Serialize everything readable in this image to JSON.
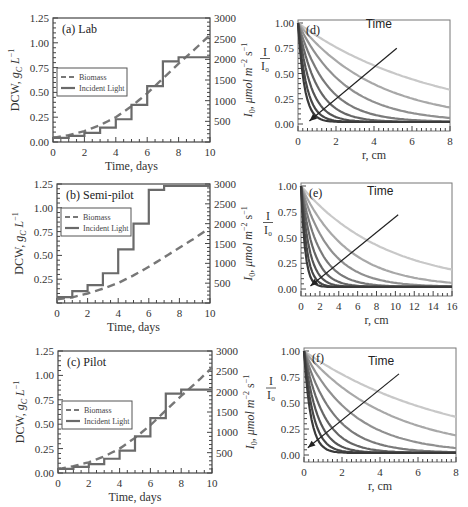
{
  "chart_data": [
    {
      "id": "a",
      "type": "line",
      "title": "(a) Lab",
      "xlabel": "Time, days",
      "ylabel": "DCW, g_C L^-1",
      "ylabel_right": "I_0, μmol m^-2 s^-1",
      "xlim": [
        0,
        10
      ],
      "ylim": [
        0,
        1.25
      ],
      "ylim_right": [
        0,
        3000
      ],
      "xticks": [
        "0",
        "2",
        "4",
        "6",
        "8",
        "10"
      ],
      "yticks": [
        "0.00",
        "0.25",
        "0.50",
        "0.75",
        "1.00",
        "1.25"
      ],
      "yticks_right": [
        "500",
        "1000",
        "1500",
        "2000",
        "2500",
        "3000"
      ],
      "legend": [
        "Biomass",
        "Incident Light"
      ],
      "legend_position": "center-left",
      "series": [
        {
          "name": "Biomass",
          "style": "dashed",
          "axis": "left",
          "x": [
            0,
            1,
            2,
            3,
            4,
            5,
            6,
            7,
            8,
            9,
            10
          ],
          "values": [
            0.04,
            0.07,
            0.11,
            0.17,
            0.25,
            0.36,
            0.49,
            0.64,
            0.79,
            0.93,
            1.08
          ]
        },
        {
          "name": "Incident Light",
          "style": "step",
          "axis": "right",
          "x": [
            0,
            1,
            2,
            3,
            4,
            5,
            6,
            7,
            8,
            10
          ],
          "values": [
            100,
            150,
            220,
            350,
            550,
            900,
            1350,
            1950,
            2050,
            2050
          ]
        }
      ]
    },
    {
      "id": "b",
      "type": "line",
      "title": "(b) Semi-pilot",
      "xlabel": "Time, days",
      "ylabel": "DCW, g_C L^-1",
      "ylabel_right": "I_0, μmol m^-2 s^-1",
      "xlim": [
        0,
        10
      ],
      "ylim": [
        0,
        1.25
      ],
      "ylim_right": [
        0,
        3000
      ],
      "xticks": [
        "0",
        "2",
        "4",
        "6",
        "8",
        "10"
      ],
      "yticks": [
        "0.25",
        "0.50",
        "0.75",
        "1.00",
        "1.25"
      ],
      "yticks_right": [
        "500",
        "1000",
        "1500",
        "2000",
        "2500",
        "3000"
      ],
      "legend": [
        "Biomass",
        "Incident Light"
      ],
      "legend_position": "upper-left",
      "series": [
        {
          "name": "Biomass",
          "style": "dashed",
          "axis": "left",
          "x": [
            0,
            1,
            2,
            3,
            4,
            5,
            6,
            7,
            8,
            9,
            10
          ],
          "values": [
            0.04,
            0.06,
            0.1,
            0.15,
            0.21,
            0.29,
            0.38,
            0.48,
            0.58,
            0.68,
            0.79
          ]
        },
        {
          "name": "Incident Light",
          "style": "step",
          "axis": "right",
          "x": [
            0,
            1,
            2,
            3,
            4,
            5,
            6,
            7,
            10
          ],
          "values": [
            150,
            300,
            450,
            750,
            1350,
            2000,
            2850,
            2950,
            2950
          ]
        }
      ]
    },
    {
      "id": "c",
      "type": "line",
      "title": "(c) Pilot",
      "xlabel": "Time, days",
      "ylabel": "DCW, g_C L^-1",
      "ylabel_right": "I_0, μmol m^-2 s^-1",
      "xlim": [
        0,
        10
      ],
      "ylim": [
        0,
        1.25
      ],
      "ylim_right": [
        0,
        3000
      ],
      "xticks": [
        "0",
        "2",
        "4",
        "6",
        "8",
        "10"
      ],
      "yticks": [
        "0.00",
        "0.25",
        "0.50",
        "0.75",
        "1.00",
        "1.25"
      ],
      "yticks_right": [
        "500",
        "1000",
        "1500",
        "2000",
        "2500",
        "3000"
      ],
      "legend": [
        "Biomass",
        "Incident Light"
      ],
      "legend_position": "center-left",
      "series": [
        {
          "name": "Biomass",
          "style": "dashed",
          "axis": "left",
          "x": [
            0,
            1,
            2,
            3,
            4,
            5,
            6,
            7,
            8,
            9,
            10
          ],
          "values": [
            0.04,
            0.07,
            0.11,
            0.17,
            0.25,
            0.36,
            0.49,
            0.64,
            0.79,
            0.93,
            1.08
          ]
        },
        {
          "name": "Incident Light",
          "style": "step",
          "axis": "right",
          "x": [
            0,
            1,
            2,
            3,
            4,
            5,
            6,
            7,
            8,
            10
          ],
          "values": [
            100,
            150,
            220,
            350,
            550,
            900,
            1350,
            1950,
            2050,
            2050
          ]
        }
      ]
    },
    {
      "id": "d",
      "type": "line",
      "title": "(d)",
      "xlabel": "r, cm",
      "ylabel": "I / I_0",
      "xlim": [
        0,
        8
      ],
      "ylim": [
        0,
        1.0
      ],
      "xticks": [
        "0",
        "2",
        "4",
        "6",
        "8"
      ],
      "yticks": [
        "0.00",
        "0.25",
        "0.50",
        "0.75",
        "1.00"
      ],
      "annotation": "Time",
      "arrow": {
        "from": [
          5.2,
          0.75
        ],
        "to": [
          0.6,
          0.03
        ]
      },
      "series_decay_rates": [
        0.14,
        0.24,
        0.4,
        0.65,
        1.0,
        1.5,
        2.2,
        3.0
      ],
      "series_floor": [
        0.02,
        0.02,
        0.02,
        0.02,
        0.02,
        0.02,
        0.02,
        0.02
      ],
      "series_gray": [
        "#c8c8c8",
        "#a8a8a8",
        "#909090",
        "#7a7a7a",
        "#666666",
        "#555555",
        "#474747",
        "#3a3a3a"
      ]
    },
    {
      "id": "e",
      "type": "line",
      "title": "(e)",
      "xlabel": "r, cm",
      "ylabel": "I / I_0",
      "xlim": [
        0,
        16
      ],
      "ylim": [
        0,
        1.0
      ],
      "xticks": [
        "0",
        "2",
        "4",
        "6",
        "8",
        "10",
        "12",
        "14",
        "16"
      ],
      "yticks": [
        "0.00",
        "0.25",
        "0.50",
        "0.75",
        "1.00"
      ],
      "annotation": "Time",
      "arrow": {
        "from": [
          10.3,
          0.72
        ],
        "to": [
          1.0,
          0.03
        ]
      },
      "series_decay_rates": [
        0.11,
        0.2,
        0.32,
        0.5,
        0.75,
        1.1,
        1.6,
        2.3
      ],
      "series_floor": [
        0.02,
        0.02,
        0.02,
        0.02,
        0.02,
        0.02,
        0.02,
        0.02
      ],
      "series_gray": [
        "#c8c8c8",
        "#a8a8a8",
        "#909090",
        "#7a7a7a",
        "#666666",
        "#555555",
        "#474747",
        "#3a3a3a"
      ]
    },
    {
      "id": "f",
      "type": "line",
      "title": "(f)",
      "xlabel": "r, cm",
      "ylabel": "I / I_0",
      "xlim": [
        0,
        8
      ],
      "ylim": [
        0,
        1.0
      ],
      "xticks": [
        "0",
        "2",
        "4",
        "6",
        "8"
      ],
      "yticks": [
        "0.00",
        "0.25",
        "0.50",
        "0.75",
        "1.00"
      ],
      "annotation": "Time",
      "arrow": {
        "from": [
          5.0,
          0.78
        ],
        "to": [
          0.2,
          0.07
        ]
      },
      "series_decay_rates": [
        0.13,
        0.22,
        0.38,
        0.62,
        0.95,
        1.4,
        2.0,
        2.8
      ],
      "series_floor": [
        0.02,
        0.02,
        0.02,
        0.02,
        0.02,
        0.02,
        0.02,
        0.02
      ],
      "series_gray": [
        "#c8c8c8",
        "#a8a8a8",
        "#909090",
        "#7a7a7a",
        "#666666",
        "#555555",
        "#474747",
        "#3a3a3a"
      ]
    }
  ],
  "layout": {
    "left_panels": [
      {
        "id": "a",
        "box": [
          53,
          18,
          210,
          142
        ]
      },
      {
        "id": "b",
        "box": [
          57,
          184,
          210,
          303
        ]
      },
      {
        "id": "c",
        "box": [
          58,
          351,
          212,
          473
        ]
      }
    ],
    "right_panels": [
      {
        "id": "d",
        "box": [
          298,
          20,
          450,
          131
        ]
      },
      {
        "id": "e",
        "box": [
          301,
          183,
          452,
          296
        ]
      },
      {
        "id": "f",
        "box": [
          304,
          348,
          456,
          462
        ]
      }
    ],
    "colors": {
      "biomass": "#777777",
      "light": "#6a6a6a",
      "axis": "#444444",
      "arrow": "#222222"
    }
  }
}
